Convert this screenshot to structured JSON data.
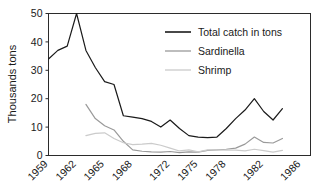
{
  "chart_data": {
    "type": "line",
    "title": "",
    "xlabel": "",
    "ylabel": "Thousands tons",
    "ylim": [
      0,
      50
    ],
    "xlim": [
      1959,
      1987
    ],
    "grid": false,
    "legend_position": "top-right",
    "y_ticks": [
      "0",
      "10",
      "20",
      "30",
      "40",
      "50"
    ],
    "y_tick_values": [
      0,
      10,
      20,
      30,
      40,
      50
    ],
    "x_ticks": [
      "1959",
      "1962",
      "1965",
      "1968",
      "1972",
      "1975",
      "1978",
      "1982",
      "1986"
    ],
    "x_tick_values": [
      1959,
      1962,
      1965,
      1968,
      1972,
      1975,
      1978,
      1982,
      1986
    ],
    "x": [
      1959,
      1960,
      1961,
      1962,
      1963,
      1964,
      1965,
      1966,
      1967,
      1968,
      1969,
      1970,
      1971,
      1972,
      1973,
      1974,
      1975,
      1976,
      1977,
      1978,
      1979,
      1980,
      1981,
      1982,
      1983,
      1984
    ],
    "series": [
      {
        "name": "Total catch in tons",
        "color": "#1a1a1a",
        "x": [
          1959,
          1960,
          1961,
          1962,
          1963,
          1964,
          1965,
          1966,
          1967,
          1968,
          1969,
          1970,
          1971,
          1972,
          1973,
          1974,
          1975,
          1976,
          1977,
          1978,
          1979,
          1980,
          1981,
          1982,
          1983,
          1984
        ],
        "values": [
          34,
          37,
          38.5,
          50,
          37,
          31,
          26,
          25,
          14,
          13.5,
          13,
          12,
          10,
          12.5,
          9.5,
          7,
          6.5,
          6.3,
          6.5,
          9.5,
          13,
          16,
          20,
          15.5,
          12.5,
          16.5
        ]
      },
      {
        "name": "Sardinella",
        "color": "#9a9a9a",
        "x": [
          1963,
          1964,
          1965,
          1966,
          1967,
          1968,
          1969,
          1970,
          1971,
          1972,
          1973,
          1974,
          1975,
          1976,
          1977,
          1978,
          1979,
          1980,
          1981,
          1982,
          1983,
          1984
        ],
        "values": [
          18,
          13,
          10.5,
          9,
          5,
          2,
          1.5,
          1.3,
          1.2,
          1.4,
          1,
          1.3,
          1.2,
          1.8,
          2,
          2.2,
          2.6,
          4,
          6.5,
          4.6,
          4.4,
          6
        ]
      },
      {
        "name": "Shrimp",
        "color": "#cbcbcb",
        "x": [
          1963,
          1964,
          1965,
          1966,
          1967,
          1968,
          1969,
          1970,
          1971,
          1972,
          1973,
          1974,
          1975,
          1976,
          1977,
          1978,
          1979,
          1980,
          1981,
          1982,
          1983,
          1984
        ],
        "values": [
          7,
          7.8,
          8,
          6,
          4.5,
          3.8,
          4,
          4.3,
          3.6,
          2.6,
          1.6,
          2,
          1.3,
          2,
          2,
          1.9,
          1.9,
          1.6,
          2.2,
          1.7,
          1.2,
          1.8
        ]
      }
    ]
  },
  "legend": {
    "items": [
      {
        "label": "Total catch in tons",
        "color": "#1a1a1a"
      },
      {
        "label": "Sardinella",
        "color": "#9a9a9a"
      },
      {
        "label": "Shrimp",
        "color": "#cbcbcb"
      }
    ]
  },
  "axes": {
    "y_title": "Thousands tons"
  }
}
